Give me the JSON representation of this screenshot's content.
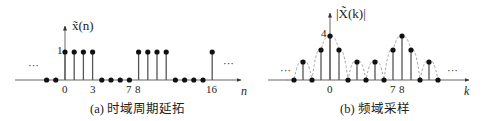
{
  "chart_data": [
    {
      "type": "stem",
      "title": "(a) 时域周期延拓",
      "ylabel": "x̃(n)",
      "xlabel": "n",
      "y_tick_labels": [
        "1"
      ],
      "x_tick_labels": [
        "0",
        "3",
        "7",
        "8",
        "16"
      ],
      "x": [
        -2,
        -1,
        0,
        1,
        2,
        3,
        4,
        5,
        6,
        7,
        8,
        9,
        10,
        11,
        12,
        13,
        14,
        15,
        16
      ],
      "values": [
        0,
        0,
        1,
        1,
        1,
        1,
        0,
        0,
        0,
        0,
        1,
        1,
        1,
        1,
        0,
        0,
        0,
        0,
        1
      ],
      "period": 8,
      "ellipsis": [
        "left",
        "right"
      ],
      "grid": false
    },
    {
      "type": "stem",
      "title": "(b) 频域采样",
      "ylabel": "|X̃(k)|",
      "xlabel": "k",
      "y_tick_labels": [
        "4"
      ],
      "x_tick_labels": [
        "0",
        "7",
        "8"
      ],
      "x": [
        -4,
        -3,
        -2,
        -1,
        0,
        1,
        2,
        3,
        4,
        5,
        6,
        7,
        8,
        9,
        10,
        11,
        12
      ],
      "values": [
        0,
        1.08,
        0,
        2.61,
        4,
        2.61,
        0,
        1.08,
        0,
        1.08,
        0,
        2.61,
        4,
        2.61,
        0,
        1.08,
        0
      ],
      "envelope": "dashed continuous |X(e^jω)|",
      "ellipsis": [
        "left",
        "right"
      ],
      "grid": false
    }
  ],
  "captions": {
    "left": "(a) 时域周期延拓",
    "right": "(b) 频域采样"
  },
  "labels": {
    "left_ylabel": "x̃(n)",
    "left_xlabel": "n",
    "left_ytick": "1",
    "left_xticks": [
      "0",
      "3",
      "7",
      "8",
      "16"
    ],
    "right_ylabel": "|X̃(k)|",
    "right_xlabel": "k",
    "right_ytick": "4",
    "right_xticks": [
      "0",
      "7",
      "8"
    ],
    "ellipsis": "···"
  },
  "colors": {
    "axis": "#555555",
    "stem": "#555555",
    "dot": "#111111",
    "envelope": "#999999"
  }
}
